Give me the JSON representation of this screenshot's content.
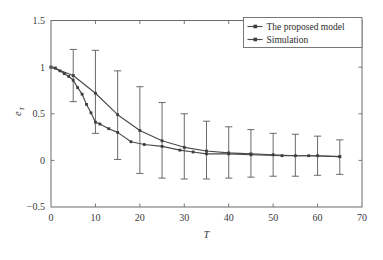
{
  "chart_data": {
    "type": "line",
    "title": "",
    "xlabel": "T",
    "ylabel": "e_T",
    "ylabel_base": "e",
    "ylabel_sub": "T",
    "xlim": [
      0,
      70
    ],
    "ylim": [
      -0.5,
      1.5
    ],
    "xticks": [
      0,
      10,
      20,
      30,
      40,
      50,
      60,
      70
    ],
    "xtick_labels": [
      "0",
      "10",
      "20",
      "30",
      "40",
      "50",
      "60",
      "70"
    ],
    "yticks": [
      -0.5,
      0,
      0.5,
      1,
      1.5
    ],
    "ytick_labels": [
      "-0.5",
      "0",
      "0.5",
      "1",
      "1.5"
    ],
    "grid": false,
    "legend_position": "top-right",
    "colors": {
      "line": "#4a4a4a",
      "marker": "#3d3d3d",
      "errorbar": "#5a5a5a",
      "frame": "#6b6b6b",
      "text": "#3a3a3a",
      "background": "#ffffff"
    },
    "series": [
      {
        "name": "The proposed model",
        "marker": "square",
        "x": [
          0,
          5,
          10,
          15,
          20,
          25,
          30,
          35,
          40,
          45,
          50,
          55,
          60,
          65
        ],
        "values": [
          1.0,
          0.91,
          0.72,
          0.49,
          0.32,
          0.21,
          0.14,
          0.1,
          0.08,
          0.07,
          0.06,
          0.05,
          0.05,
          0.04
        ],
        "error_low": [
          1.0,
          0.63,
          0.29,
          0.01,
          -0.14,
          -0.19,
          -0.2,
          -0.2,
          -0.19,
          -0.18,
          -0.17,
          -0.17,
          -0.16,
          -0.15
        ],
        "error_high": [
          1.0,
          1.19,
          1.18,
          0.96,
          0.79,
          0.62,
          0.5,
          0.42,
          0.36,
          0.33,
          0.29,
          0.28,
          0.26,
          0.22
        ]
      },
      {
        "name": "Simulation",
        "marker": "square",
        "x": [
          0,
          1,
          2,
          3,
          4,
          5,
          6,
          7,
          8,
          9,
          10,
          11,
          13,
          15,
          18,
          21,
          25,
          29,
          32,
          35,
          40,
          45,
          52,
          58,
          65
        ],
        "values": [
          1.0,
          0.99,
          0.96,
          0.93,
          0.9,
          0.86,
          0.78,
          0.71,
          0.6,
          0.51,
          0.41,
          0.39,
          0.34,
          0.3,
          0.2,
          0.17,
          0.15,
          0.11,
          0.09,
          0.07,
          0.07,
          0.06,
          0.05,
          0.05,
          0.04
        ]
      }
    ]
  },
  "legend": {
    "entries": [
      {
        "label": "The proposed model"
      },
      {
        "label": "Simulation"
      }
    ]
  }
}
